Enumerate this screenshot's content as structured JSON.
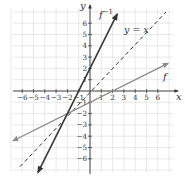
{
  "chart_data": {
    "type": "line",
    "title": "",
    "xlabel": "x",
    "ylabel": "y",
    "xlim": [
      -7,
      7
    ],
    "ylim": [
      -7,
      7
    ],
    "grid": true,
    "x_ticks": [
      -6,
      -5,
      -4,
      -3,
      -2,
      -1,
      1,
      2,
      3,
      4,
      5,
      6
    ],
    "y_ticks": [
      -6,
      -5,
      -4,
      -3,
      -2,
      -1,
      1,
      2,
      3,
      4,
      5,
      6
    ],
    "x_tick_labels": [
      "−6",
      "−5",
      "−4",
      "−3",
      "−2",
      "−1",
      "1",
      "2",
      "3",
      "4",
      "5",
      "6"
    ],
    "y_tick_labels": [
      "−6",
      "−5",
      "−4",
      "−3",
      "−2",
      "−1",
      "1",
      "2",
      "3",
      "4",
      "5",
      "6"
    ],
    "series": [
      {
        "name": "f",
        "label": "f",
        "equation": "y = x/2 - 1",
        "style": "solid",
        "color": "#8a8a8a",
        "x": [
          -7,
          7
        ],
        "y": [
          -4.5,
          2.5
        ],
        "points": [
          [
            -2,
            -2
          ],
          [
            0,
            -1
          ],
          [
            2,
            0
          ]
        ]
      },
      {
        "name": "f_inverse",
        "label": "f⁻¹",
        "equation": "y = 2x + 2",
        "style": "solid",
        "color": "#333333",
        "x": [
          -4.5,
          2.5
        ],
        "y": [
          -7,
          7
        ],
        "points": [
          [
            -2,
            -2
          ],
          [
            -1,
            0
          ],
          [
            0,
            2
          ]
        ]
      },
      {
        "name": "identity",
        "label": "y = x",
        "equation": "y = x",
        "style": "dashed",
        "color": "#333333",
        "x": [
          -7,
          7
        ],
        "y": [
          -7,
          7
        ]
      }
    ],
    "annotations": [
      {
        "text": "f⁻¹",
        "near": [
          1.5,
          6.5
        ]
      },
      {
        "text": "y = x",
        "near": [
          4,
          5.3
        ]
      },
      {
        "text": "f",
        "near": [
          6.6,
          1.2
        ]
      }
    ],
    "intersection": [
      -2,
      -2
    ]
  },
  "labels": {
    "x_axis": "x",
    "y_axis": "y",
    "f": "f",
    "f_inv_base": "f",
    "f_inv_sup": "−1",
    "identity": "y = x"
  }
}
